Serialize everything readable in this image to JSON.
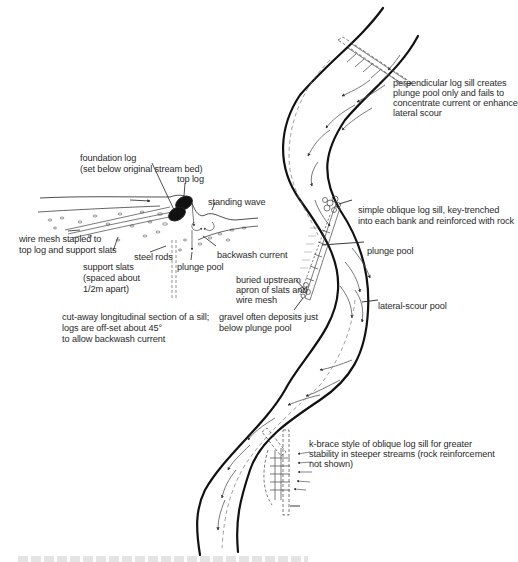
{
  "figure": {
    "type": "technical illustration",
    "caption_visible": false
  },
  "section_view": {
    "labels": {
      "foundation_log": "foundation log",
      "foundation_log_note": "(set below original stream bed)",
      "top_log": "top log",
      "standing_wave": "standing wave",
      "wire_mesh_1": "wire mesh stapled to",
      "wire_mesh_2": "top log and support slats",
      "support_slats_1": "support slats",
      "support_slats_2": "(spaced about",
      "support_slats_3": "1/2m apart)",
      "steel_rods": "steel rods",
      "plunge_pool": "plunge pool",
      "backwash_current": "backwash current"
    },
    "description_lines": [
      "cut-away longitudinal section of a sill;",
      "logs are off-set about 45°",
      "to allow backwash current"
    ]
  },
  "plan_view": {
    "labels": {
      "perpendicular_1": "perpendicular log sill creates",
      "perpendicular_2": "plunge pool only and fails to",
      "perpendicular_3": "concentrate current or enhance",
      "perpendicular_4": "lateral scour",
      "oblique_1": "simple oblique log sill, key-trenched",
      "oblique_2": "into each bank and reinforced with rock",
      "plunge_pool": "plunge pool",
      "buried_1": "buried upstream",
      "buried_2": "apron of slats and",
      "buried_3": "wire mesh",
      "gravel_1": "gravel often deposits just",
      "gravel_2": "below plunge pool",
      "lateral_scour": "lateral-scour pool",
      "kbrace_1": "k-brace style of oblique log sill for greater",
      "kbrace_2": "stability in steeper streams (rock reinforcement",
      "kbrace_3": "not shown)"
    }
  },
  "colors": {
    "ink": "#1a1a1a",
    "label": "#2a2a2a",
    "background": "#ffffff"
  }
}
